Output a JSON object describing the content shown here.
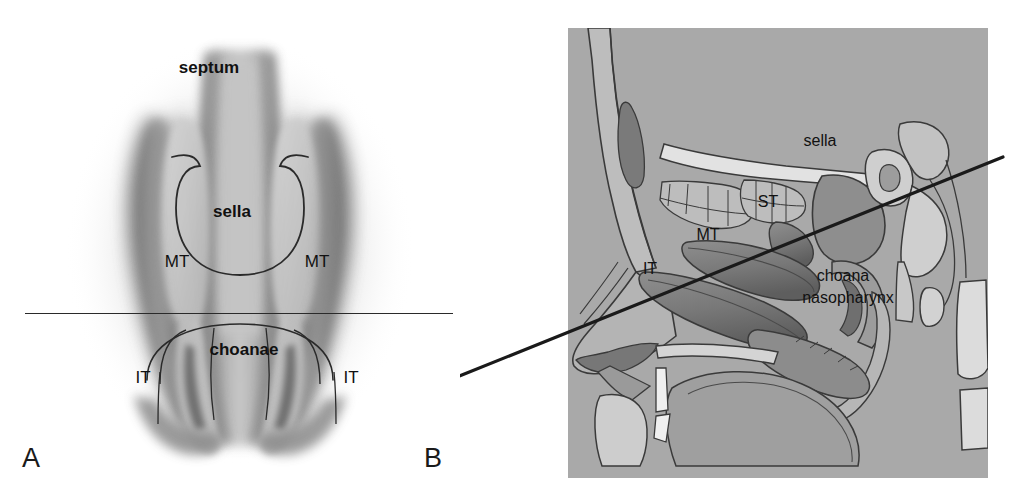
{
  "figure": {
    "type": "medical-anatomical-illustration",
    "background_color": "#ffffff",
    "plate_color": "#a9a9a9"
  },
  "panels": [
    {
      "id": "A",
      "label": "A",
      "view": "coronal endoscopic view of the nasal cavity",
      "labels": [
        {
          "name": "septum",
          "text": "septum",
          "x": 209,
          "y": 68,
          "size": 17,
          "bold": true,
          "anchor": "middle"
        },
        {
          "name": "sella",
          "text": "sella",
          "x": 232,
          "y": 212,
          "size": 17,
          "bold": true,
          "anchor": "middle"
        },
        {
          "name": "mt-left",
          "text": "MT",
          "x": 177,
          "y": 262,
          "size": 17,
          "bold": false,
          "anchor": "middle"
        },
        {
          "name": "mt-right",
          "text": "MT",
          "x": 317,
          "y": 262,
          "size": 17,
          "bold": false,
          "anchor": "middle"
        },
        {
          "name": "choanae",
          "text": "choanae",
          "x": 244,
          "y": 350,
          "size": 17,
          "bold": true,
          "anchor": "middle"
        },
        {
          "name": "it-left",
          "text": "IT",
          "x": 143,
          "y": 378,
          "size": 17,
          "bold": false,
          "anchor": "middle"
        },
        {
          "name": "it-right",
          "text": "IT",
          "x": 351,
          "y": 378,
          "size": 17,
          "bold": false,
          "anchor": "middle"
        }
      ],
      "reference_line": {
        "name": "axial-reference-line",
        "orientation": "horizontal",
        "x1": 25,
        "y1": 313,
        "x2": 453,
        "y2": 313,
        "color": "#2a2a2a"
      }
    },
    {
      "id": "B",
      "label": "B",
      "view": "midsagittal section of the nose, nasopharynx and sella",
      "labels": [
        {
          "name": "sella",
          "text": "sella",
          "x": 820,
          "y": 142,
          "size": 16,
          "bold": false,
          "anchor": "middle"
        },
        {
          "name": "st",
          "text": "ST",
          "x": 768,
          "y": 203,
          "size": 16,
          "bold": false,
          "anchor": "middle"
        },
        {
          "name": "mt",
          "text": "MT",
          "x": 708,
          "y": 236,
          "size": 16,
          "bold": false,
          "anchor": "middle"
        },
        {
          "name": "it",
          "text": "IT",
          "x": 650,
          "y": 270,
          "size": 16,
          "bold": false,
          "anchor": "middle"
        },
        {
          "name": "choana",
          "text": "choana",
          "x": 843,
          "y": 277,
          "size": 16,
          "bold": false,
          "anchor": "middle"
        },
        {
          "name": "nasopharynx",
          "text": "nasopharynx",
          "x": 848,
          "y": 299,
          "size": 16,
          "bold": false,
          "anchor": "middle"
        }
      ],
      "reference_line": {
        "name": "sella-trajectory-line",
        "orientation": "oblique",
        "x1": 452,
        "y1": 379,
        "x2": 1003,
        "y2": 157,
        "color": "#1a1a1a"
      }
    }
  ],
  "panel_labels": {
    "a": {
      "text": "A",
      "x": 22,
      "y": 457
    },
    "b": {
      "text": "B",
      "x": 424,
      "y": 457
    }
  },
  "abbreviations": [
    {
      "abbr": "MT",
      "meaning": "middle turbinate"
    },
    {
      "abbr": "IT",
      "meaning": "inferior turbinate"
    },
    {
      "abbr": "ST",
      "meaning": "superior turbinate"
    }
  ]
}
